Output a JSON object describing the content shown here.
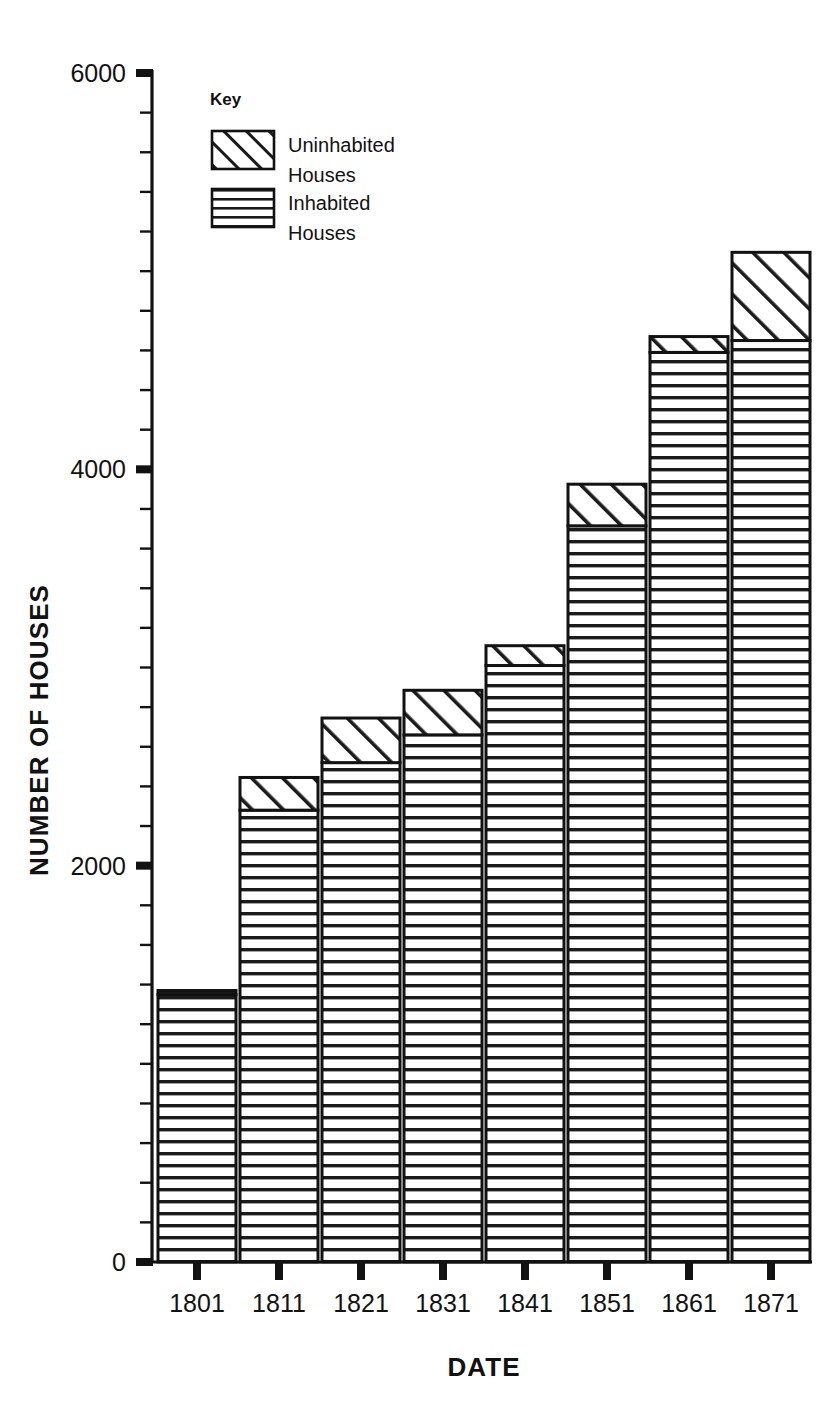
{
  "chart_data": {
    "type": "bar",
    "subtype": "stacked-bar",
    "title": "",
    "xlabel": "DATE",
    "ylabel": "NUMBER OF HOUSES",
    "categories": [
      "1801",
      "1811",
      "1821",
      "1831",
      "1841",
      "1851",
      "1861",
      "1871"
    ],
    "series": [
      {
        "name": "Inhabited Houses",
        "pattern": "horizontal-lines",
        "values": [
          1350,
          2280,
          2520,
          2660,
          3010,
          3715,
          4590,
          4650
        ]
      },
      {
        "name": "Uninhabited Houses",
        "pattern": "diagonal-hatch",
        "values": [
          20,
          165,
          225,
          225,
          100,
          210,
          80,
          445
        ]
      }
    ],
    "totals": [
      1370,
      2445,
      2745,
      2885,
      3110,
      3925,
      4670,
      5095
    ],
    "ylim": [
      0,
      6000
    ],
    "y_major_ticks": [
      0,
      2000,
      4000,
      6000
    ],
    "y_major_tick_labels": [
      "0",
      "2000",
      "4000",
      "6000"
    ],
    "y_minor_tick_interval": 200,
    "grid": false,
    "legend_position": "top-left-inside"
  },
  "legend": {
    "title": "Key",
    "entries": [
      {
        "label_line1": "Uninhabited",
        "label_line2": "Houses",
        "pattern": "diagonal-hatch"
      },
      {
        "label_line1": "Inhabited",
        "label_line2": "Houses",
        "pattern": "horizontal-lines"
      }
    ]
  },
  "axes": {
    "y_title": "NUMBER OF HOUSES",
    "x_title": "DATE",
    "y_labels": [
      "6000",
      "4000",
      "2000",
      "0"
    ],
    "x_labels": [
      "1801",
      "1811",
      "1821",
      "1831",
      "1841",
      "1851",
      "1861",
      "1871"
    ]
  },
  "colors": {
    "ink": "#121212",
    "background": "#ffffff",
    "bar_fill": "#ffffff"
  }
}
